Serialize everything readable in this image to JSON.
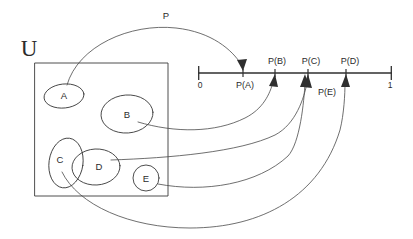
{
  "diagram": {
    "type": "probability-measure-mapping",
    "universe_label": "U",
    "map_label": "P",
    "sets": [
      {
        "id": "A",
        "label": "A"
      },
      {
        "id": "B",
        "label": "B"
      },
      {
        "id": "C",
        "label": "C"
      },
      {
        "id": "D",
        "label": "D"
      },
      {
        "id": "E",
        "label": "E"
      }
    ],
    "number_line": {
      "start_label": "0",
      "end_label": "1",
      "ticks": [
        {
          "id": "PA",
          "label": "P(A)",
          "position": 0.23
        },
        {
          "id": "PB",
          "label": "P(B)",
          "position": 0.4
        },
        {
          "id": "PC",
          "label": "P(C)",
          "position": 0.57
        },
        {
          "id": "PD",
          "label": "P(D)",
          "position": 0.76
        }
      ],
      "extra_labels": [
        {
          "id": "PE",
          "label": "P(E)",
          "maps_to": "PC"
        }
      ]
    },
    "mappings": [
      {
        "from": "A",
        "to": "P(A)"
      },
      {
        "from": "B",
        "to": "P(B)"
      },
      {
        "from": "C",
        "to": "P(C)"
      },
      {
        "from": "D",
        "to": "P(D)"
      },
      {
        "from": "E",
        "to": "P(C)"
      }
    ],
    "colors": {
      "ink": "#3b3b3b",
      "axis": "#2f2f2f",
      "background": "#ffffff"
    }
  }
}
